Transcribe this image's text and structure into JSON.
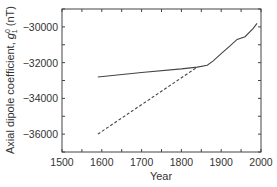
{
  "chart_data": {
    "type": "line",
    "title": "",
    "xlabel": "Year",
    "ylabel": "Axial dipole coefficient, g10 (nT)",
    "ylabel_parts": {
      "main": "Axial dipole coefficient, ",
      "sym": "g",
      "sup": "0",
      "sub": "1",
      "unit": " (nT)"
    },
    "xlim": [
      1500,
      2000
    ],
    "ylim": [
      -37000,
      -29000
    ],
    "x_ticks": [
      1500,
      1600,
      1700,
      1800,
      1900,
      2000
    ],
    "x_tick_labels": [
      "1500",
      "1600",
      "1700",
      "1800",
      "1900",
      "2000"
    ],
    "y_ticks": [
      -30000,
      -32000,
      -34000,
      -36000
    ],
    "y_tick_labels": [
      "−30000",
      "−32000",
      "−34000",
      "−36000"
    ],
    "grid": false,
    "legend": null,
    "series": [
      {
        "name": "solid",
        "style": "solid",
        "x": [
          1590,
          1700,
          1800,
          1840,
          1865,
          1880,
          1900,
          1920,
          1940,
          1960,
          1980,
          1990
        ],
        "y": [
          -32800,
          -32550,
          -32350,
          -32250,
          -32150,
          -31900,
          -31500,
          -31100,
          -30700,
          -30550,
          -30100,
          -29800
        ]
      },
      {
        "name": "dashed",
        "style": "dashed",
        "x": [
          1590,
          1840
        ],
        "y": [
          -36000,
          -32250
        ]
      }
    ]
  }
}
